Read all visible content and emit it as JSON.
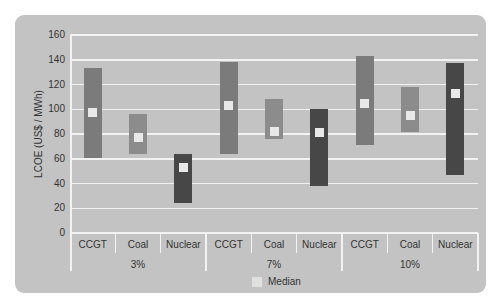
{
  "chart_data": {
    "type": "bar",
    "subtype": "floating-range-with-median",
    "title": "",
    "xlabel": "",
    "ylabel": "LCOE (US$ / MWh)",
    "ylim": [
      0,
      160
    ],
    "yticks": [
      0,
      20,
      40,
      60,
      80,
      100,
      120,
      140,
      160
    ],
    "grid": true,
    "legend": {
      "position": "bottom",
      "entries": [
        "Median"
      ]
    },
    "groups": [
      "3%",
      "7%",
      "10%"
    ],
    "categories": [
      "CCGT",
      "Coal",
      "Nuclear",
      "CCGT",
      "Coal",
      "Nuclear",
      "CCGT",
      "Coal",
      "Nuclear"
    ],
    "series": [
      {
        "name": "Min",
        "values": [
          61,
          64,
          24,
          64,
          76,
          38,
          71,
          82,
          47
        ]
      },
      {
        "name": "Max",
        "values": [
          133,
          96,
          64,
          138,
          108,
          100,
          143,
          118,
          137
        ]
      },
      {
        "name": "Median",
        "values": [
          97,
          77,
          53,
          103,
          82,
          81,
          105,
          95,
          113
        ]
      }
    ],
    "colors": {
      "CCGT": "#7b7b7b",
      "Coal": "#8c8c8c",
      "Nuclear": "#474747",
      "Median": "#e8e8e8"
    }
  },
  "axis": {
    "ylabel": "LCOE (US$ / MWh)",
    "yticks": [
      "160",
      "140",
      "120",
      "100",
      "80",
      "60",
      "40",
      "20",
      "0"
    ],
    "categories": [
      "CCGT",
      "Coal",
      "Nuclear",
      "CCGT",
      "Coal",
      "Nuclear",
      "CCGT",
      "Coal",
      "Nuclear"
    ],
    "groups": [
      "3%",
      "7%",
      "10%"
    ]
  },
  "legend": {
    "median_label": "Median"
  }
}
